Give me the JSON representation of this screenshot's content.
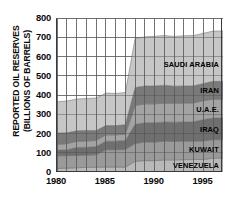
{
  "chart_data": {
    "type": "area",
    "title": "",
    "subtitle": "",
    "xlabel": "",
    "ylabel": "REPORTED OIL RESERVES (BILLIONS OF BARRELS)",
    "ylabel_lines": [
      "REPORTED OIL RESERVES",
      "(BILLIONS OF BARRELS)"
    ],
    "stacked": true,
    "grid": true,
    "grid_x": "yearly",
    "legend_position": "inline-right",
    "xlim": [
      1980,
      1997
    ],
    "ylim": [
      0,
      800
    ],
    "yticks": [
      0,
      100,
      200,
      300,
      400,
      500,
      600,
      700,
      800
    ],
    "ytick_labels": [
      "0",
      "100",
      "200",
      "300",
      "400",
      "500",
      "600",
      "700",
      "800"
    ],
    "xticks": [
      1980,
      1985,
      1990,
      1995
    ],
    "xtick_labels": [
      "1980",
      "1985",
      "1990",
      "1995"
    ],
    "x": [
      1980,
      1981,
      1982,
      1983,
      1984,
      1985,
      1986,
      1987,
      1988,
      1989,
      1990,
      1991,
      1992,
      1993,
      1994,
      1995,
      1996,
      1997
    ],
    "series": [
      {
        "name": "VENEZUELA",
        "color": "#b9b9b9",
        "values": [
          18,
          20,
          22,
          24,
          25,
          26,
          26,
          25,
          56,
          59,
          59,
          63,
          63,
          64,
          65,
          65,
          72,
          72
        ]
      },
      {
        "name": "KUWAIT",
        "color": "#9a9a9a",
        "values": [
          66,
          65,
          64,
          64,
          64,
          90,
          90,
          92,
          92,
          97,
          97,
          97,
          96,
          96,
          96,
          96,
          96,
          96
        ]
      },
      {
        "name": "IRAQ",
        "color": "#6f6f6f",
        "values": [
          30,
          30,
          41,
          41,
          43,
          44,
          44,
          47,
          100,
          100,
          100,
          100,
          100,
          100,
          100,
          112,
          112,
          112
        ]
      },
      {
        "name": "U.A.E.",
        "color": "#a3a3a3",
        "values": [
          30,
          32,
          32,
          32,
          32,
          33,
          33,
          33,
          98,
          98,
          98,
          98,
          98,
          98,
          98,
          98,
          98,
          98
        ]
      },
      {
        "name": "IRAN",
        "color": "#7a7a7a",
        "values": [
          58,
          57,
          55,
          55,
          51,
          48,
          48,
          49,
          93,
          93,
          93,
          93,
          89,
          89,
          89,
          89,
          93,
          93
        ]
      },
      {
        "name": "SAUDI ARABIA",
        "color": "#c6c6c6",
        "values": [
          163,
          165,
          165,
          166,
          169,
          169,
          167,
          167,
          255,
          255,
          258,
          258,
          258,
          261,
          261,
          261,
          261,
          262
        ]
      }
    ],
    "totals": [
      365,
      369,
      379,
      382,
      384,
      410,
      408,
      413,
      694,
      702,
      705,
      709,
      704,
      708,
      709,
      721,
      732,
      733
    ],
    "annotations": [
      {
        "text": "SAUDI ARABIA",
        "series": "SAUDI ARABIA"
      },
      {
        "text": "IRAN",
        "series": "IRAN"
      },
      {
        "text": "U.A.E.",
        "series": "U.A.E."
      },
      {
        "text": "IRAQ",
        "series": "IRAQ"
      },
      {
        "text": "KUWAIT",
        "series": "KUWAIT"
      },
      {
        "text": "VENEZUELA",
        "series": "VENEZUELA"
      }
    ],
    "colors": {
      "axis": "#2b2b2b",
      "grid": "#8c8c8c",
      "text": "#0a0a0a",
      "background": "#ffffff"
    }
  }
}
